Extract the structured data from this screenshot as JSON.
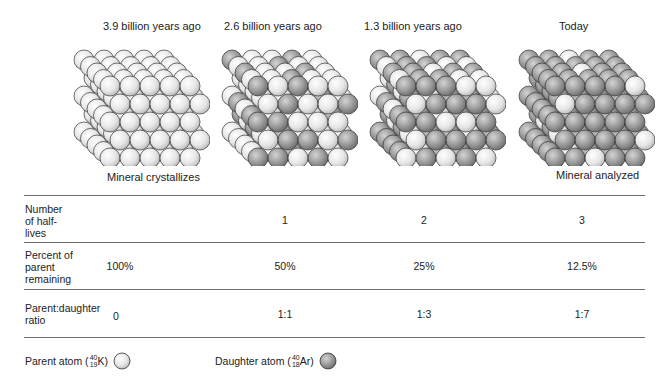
{
  "stages": [
    {
      "title": "3.9 billion years ago",
      "caption": "Mineral crystallizes",
      "front": [
        [
          0,
          0,
          0,
          0,
          0
        ],
        [
          0,
          0,
          0,
          0,
          0
        ],
        [
          0,
          0,
          0,
          0,
          0
        ],
        [
          0,
          0,
          0,
          0,
          0
        ],
        [
          0,
          0,
          0,
          0,
          0
        ]
      ]
    },
    {
      "title": "2.6 billion years ago",
      "caption": "",
      "front": [
        [
          1,
          0,
          1,
          0,
          0
        ],
        [
          0,
          1,
          0,
          0,
          1
        ],
        [
          1,
          1,
          0,
          0,
          0
        ],
        [
          0,
          1,
          1,
          0,
          1
        ],
        [
          1,
          1,
          0,
          1,
          0
        ]
      ]
    },
    {
      "title": "1.3 billion years ago",
      "caption": "",
      "front": [
        [
          1,
          1,
          1,
          0,
          0
        ],
        [
          0,
          1,
          1,
          1,
          0
        ],
        [
          1,
          1,
          0,
          0,
          1
        ],
        [
          0,
          1,
          1,
          1,
          1
        ],
        [
          0,
          1,
          0,
          1,
          0
        ]
      ]
    },
    {
      "title": "Today",
      "caption": "Mineral analyzed",
      "front": [
        [
          1,
          1,
          1,
          1,
          0
        ],
        [
          0,
          1,
          1,
          1,
          1
        ],
        [
          1,
          1,
          1,
          1,
          1
        ],
        [
          1,
          1,
          1,
          1,
          0
        ],
        [
          1,
          1,
          0,
          1,
          1
        ]
      ]
    }
  ],
  "table": {
    "rows": [
      {
        "label": "Number\nof half-\nlives",
        "values": [
          "",
          "1",
          "2",
          "3"
        ]
      },
      {
        "label": "Percent of\nparent\nremaining",
        "values": [
          "100%",
          "50%",
          "25%",
          "12.5%"
        ]
      },
      {
        "label": "Parent:daughter\nratio",
        "values": [
          "0",
          "1:1",
          "1:3",
          "1:7"
        ]
      }
    ]
  },
  "legend": {
    "parent": {
      "label": "Parent atom (",
      "mass": "40",
      "atomic": "19",
      "symbol": "K)"
    },
    "daughter": {
      "label": "Daughter atom (",
      "mass": "40",
      "atomic": "18",
      "symbol": " Ar)"
    }
  },
  "colors": {
    "parent_fill": "#ececec",
    "daughter_fill": "#9a9a9a",
    "outline": "#333333",
    "rule": "#6d6d6d"
  }
}
